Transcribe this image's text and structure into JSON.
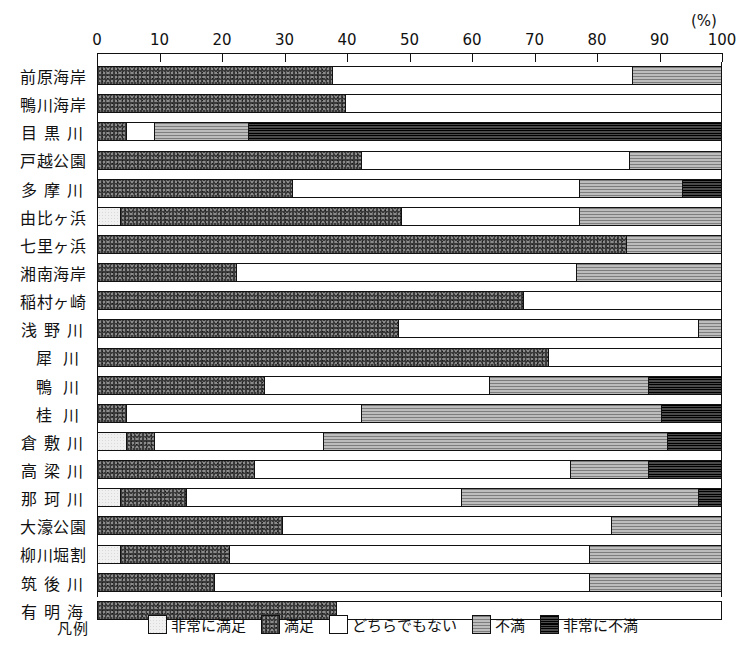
{
  "axis": {
    "unit_label": "(%)",
    "ticks": [
      0,
      10,
      20,
      30,
      40,
      50,
      60,
      70,
      80,
      90,
      100
    ],
    "min": 0,
    "max": 100
  },
  "legend": {
    "title": "凡例",
    "items": [
      {
        "label": "非常に満足",
        "key": "vsat",
        "fill": "f-vsat",
        "color": "#f0f0f0"
      },
      {
        "label": "満足",
        "key": "sat",
        "fill": "f-sat",
        "color": "#3a3a3a"
      },
      {
        "label": "どちらでもない",
        "key": "neu",
        "fill": "f-neu",
        "color": "#ffffff"
      },
      {
        "label": "不満",
        "key": "dis",
        "fill": "f-dis",
        "color": "#a8a8a8"
      },
      {
        "label": "非常に不満",
        "key": "vdis",
        "fill": "f-vdis",
        "color": "#2e2e2e"
      }
    ]
  },
  "chart_data": {
    "type": "bar",
    "orientation": "horizontal",
    "stacked": true,
    "normalized_percent": true,
    "title": "",
    "xlabel": "(%)",
    "ylabel": "",
    "xlim": [
      0,
      100
    ],
    "grid": false,
    "legend_position": "bottom",
    "series": [
      {
        "name": "非常に満足",
        "key": "vsat",
        "values": [
          0,
          0,
          0,
          0,
          0,
          3.5,
          0,
          0,
          0,
          0,
          0,
          0,
          0,
          4.5,
          0,
          3.5,
          0,
          3.5,
          0,
          0
        ]
      },
      {
        "name": "満足",
        "key": "sat",
        "values": [
          37.5,
          39.5,
          4.5,
          42,
          31,
          45,
          84.5,
          22,
          68,
          48,
          72,
          26.5,
          4.5,
          4.5,
          25,
          10.5,
          29.5,
          17.5,
          18.5,
          38
        ]
      },
      {
        "name": "どちらでもない",
        "key": "neu",
        "values": [
          48,
          60.5,
          4.5,
          43,
          46,
          28.5,
          0,
          54.5,
          32,
          48,
          28,
          36,
          37.5,
          27,
          50.5,
          44,
          52.5,
          57.5,
          60,
          62
        ]
      },
      {
        "name": "不満",
        "key": "dis",
        "values": [
          14.5,
          0,
          15,
          15,
          16.5,
          23,
          15.5,
          23.5,
          0,
          4,
          0,
          25.5,
          48,
          55,
          12.5,
          38,
          18,
          21.5,
          21.5,
          0
        ]
      },
      {
        "name": "非常に不満",
        "key": "vdis",
        "values": [
          0,
          0,
          76,
          0,
          6.5,
          0,
          0,
          0,
          0,
          0,
          0,
          12,
          10,
          9,
          12,
          4,
          0,
          0,
          0,
          0
        ]
      }
    ],
    "categories": [
      "前原海岸",
      "鴨川海岸",
      "目黒川",
      "戸越公園",
      "多摩川",
      "由比ヶ浜",
      "七里ヶ浜",
      "湘南海岸",
      "稲村ヶ崎",
      "浅野川",
      "犀川",
      "鴨川",
      "桂川",
      "倉敷川",
      "高梁川",
      "那珂川",
      "大濠公園",
      "柳川堀割",
      "筑後川",
      "有明海"
    ],
    "rows": [
      {
        "label": "前原海岸",
        "spacing": "sp0",
        "segments": [
          {
            "key": "sat",
            "value": 37.5
          },
          {
            "key": "neu",
            "value": 48.0
          },
          {
            "key": "dis",
            "value": 14.5
          }
        ]
      },
      {
        "label": "鴨川海岸",
        "spacing": "sp0",
        "segments": [
          {
            "key": "sat",
            "value": 39.5
          },
          {
            "key": "neu",
            "value": 60.5
          }
        ]
      },
      {
        "label": "目黒川",
        "spacing": "sp2",
        "segments": [
          {
            "key": "sat",
            "value": 4.5
          },
          {
            "key": "neu",
            "value": 4.5
          },
          {
            "key": "dis",
            "value": 15.0
          },
          {
            "key": "vdis",
            "value": 76.0
          }
        ]
      },
      {
        "label": "戸越公園",
        "spacing": "sp0",
        "segments": [
          {
            "key": "sat",
            "value": 42.0
          },
          {
            "key": "neu",
            "value": 43.0
          },
          {
            "key": "dis",
            "value": 15.0
          }
        ]
      },
      {
        "label": "多摩川",
        "spacing": "sp2",
        "segments": [
          {
            "key": "sat",
            "value": 31.0
          },
          {
            "key": "neu",
            "value": 46.0
          },
          {
            "key": "dis",
            "value": 16.5
          },
          {
            "key": "vdis",
            "value": 6.5
          }
        ]
      },
      {
        "label": "由比ヶ浜",
        "spacing": "sp0",
        "segments": [
          {
            "key": "vsat",
            "value": 3.5
          },
          {
            "key": "sat",
            "value": 45.0
          },
          {
            "key": "neu",
            "value": 28.5
          },
          {
            "key": "dis",
            "value": 23.0
          }
        ]
      },
      {
        "label": "七里ヶ浜",
        "spacing": "sp0",
        "segments": [
          {
            "key": "sat",
            "value": 84.5
          },
          {
            "key": "dis",
            "value": 15.5
          }
        ]
      },
      {
        "label": "湘南海岸",
        "spacing": "sp0",
        "segments": [
          {
            "key": "sat",
            "value": 22.0
          },
          {
            "key": "neu",
            "value": 54.5
          },
          {
            "key": "dis",
            "value": 23.5
          }
        ]
      },
      {
        "label": "稲村ヶ崎",
        "spacing": "sp0",
        "segments": [
          {
            "key": "sat",
            "value": 68.0
          },
          {
            "key": "neu",
            "value": 32.0
          }
        ]
      },
      {
        "label": "浅野川",
        "spacing": "sp2",
        "segments": [
          {
            "key": "sat",
            "value": 48.0
          },
          {
            "key": "neu",
            "value": 48.0
          },
          {
            "key": "dis",
            "value": 4.0
          }
        ]
      },
      {
        "label": "犀川",
        "spacing": "sp3",
        "segments": [
          {
            "key": "sat",
            "value": 72.0
          },
          {
            "key": "neu",
            "value": 28.0
          }
        ]
      },
      {
        "label": "鴨川",
        "spacing": "sp3",
        "segments": [
          {
            "key": "sat",
            "value": 26.5
          },
          {
            "key": "neu",
            "value": 36.0
          },
          {
            "key": "dis",
            "value": 25.5
          },
          {
            "key": "vdis",
            "value": 12.0
          }
        ]
      },
      {
        "label": "桂川",
        "spacing": "sp3",
        "segments": [
          {
            "key": "sat",
            "value": 4.5
          },
          {
            "key": "neu",
            "value": 37.5
          },
          {
            "key": "dis",
            "value": 48.0
          },
          {
            "key": "vdis",
            "value": 10.0
          }
        ]
      },
      {
        "label": "倉敷川",
        "spacing": "sp2",
        "segments": [
          {
            "key": "vsat",
            "value": 4.5
          },
          {
            "key": "sat",
            "value": 4.5
          },
          {
            "key": "neu",
            "value": 27.0
          },
          {
            "key": "dis",
            "value": 55.0
          },
          {
            "key": "vdis",
            "value": 9.0
          }
        ]
      },
      {
        "label": "高梁川",
        "spacing": "sp2",
        "segments": [
          {
            "key": "sat",
            "value": 25.0
          },
          {
            "key": "neu",
            "value": 50.5
          },
          {
            "key": "dis",
            "value": 12.5
          },
          {
            "key": "vdis",
            "value": 12.0
          }
        ]
      },
      {
        "label": "那珂川",
        "spacing": "sp2",
        "segments": [
          {
            "key": "vsat",
            "value": 3.5
          },
          {
            "key": "sat",
            "value": 10.5
          },
          {
            "key": "neu",
            "value": 44.0
          },
          {
            "key": "dis",
            "value": 38.0
          },
          {
            "key": "vdis",
            "value": 4.0
          }
        ]
      },
      {
        "label": "大濠公園",
        "spacing": "sp0",
        "segments": [
          {
            "key": "sat",
            "value": 29.5
          },
          {
            "key": "neu",
            "value": 52.5
          },
          {
            "key": "dis",
            "value": 18.0
          }
        ]
      },
      {
        "label": "柳川堀割",
        "spacing": "sp0",
        "segments": [
          {
            "key": "vsat",
            "value": 3.5
          },
          {
            "key": "sat",
            "value": 17.5
          },
          {
            "key": "neu",
            "value": 57.5
          },
          {
            "key": "dis",
            "value": 21.5
          }
        ]
      },
      {
        "label": "筑後川",
        "spacing": "sp2",
        "segments": [
          {
            "key": "sat",
            "value": 18.5
          },
          {
            "key": "neu",
            "value": 60.0
          },
          {
            "key": "dis",
            "value": 21.5
          }
        ]
      },
      {
        "label": "有明海",
        "spacing": "sp2",
        "segments": [
          {
            "key": "sat",
            "value": 38.0
          },
          {
            "key": "neu",
            "value": 62.0
          }
        ]
      }
    ]
  }
}
